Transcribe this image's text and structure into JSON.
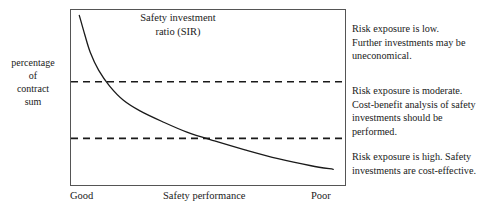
{
  "chart_data": {
    "type": "line",
    "title": "Safety investment ratio (SIR)",
    "title_lines": [
      "Safety investment",
      "ratio (SIR)"
    ],
    "xlabel": "Safety performance",
    "ylabel": "percentage of contract sum",
    "ylabel_lines": [
      "percentage",
      "of",
      "contract",
      "sum"
    ],
    "x_tick_labels": [
      "Good",
      "Safety performance",
      "Poor"
    ],
    "grid": false,
    "legend": "none",
    "xlim": [
      0,
      1
    ],
    "ylim": [
      0,
      1
    ],
    "series": [
      {
        "name": "Safety investment ratio (SIR)",
        "style": "solid",
        "color": "#1a1a1a",
        "x": [
          0.03,
          0.05,
          0.07,
          0.1,
          0.14,
          0.19,
          0.25,
          0.33,
          0.42,
          0.52,
          0.63,
          0.75,
          0.87,
          0.95
        ],
        "y": [
          0.97,
          0.86,
          0.76,
          0.66,
          0.57,
          0.49,
          0.43,
          0.37,
          0.31,
          0.26,
          0.21,
          0.16,
          0.12,
          0.1
        ]
      }
    ],
    "threshold_lines": [
      {
        "name": "upper-threshold",
        "style": "dashed",
        "color": "#1a1a1a",
        "y": 0.595
      },
      {
        "name": "lower-threshold",
        "style": "dashed",
        "color": "#1a1a1a",
        "y": 0.275
      }
    ],
    "annotations": [
      {
        "name": "low-risk",
        "zone": "above-upper-threshold",
        "lines": [
          "Risk exposure is low.",
          "Further investments may be",
          "uneconomical."
        ]
      },
      {
        "name": "moderate-risk",
        "zone": "between-thresholds",
        "lines": [
          "Risk exposure is moderate.",
          "Cost-benefit analysis of safety",
          "investments should be",
          "performed."
        ]
      },
      {
        "name": "high-risk",
        "zone": "below-lower-threshold",
        "lines": [
          "Risk exposure is high. Safety",
          "investments are cost-effective."
        ]
      }
    ]
  },
  "axis": {
    "y_label_line_1": "percentage",
    "y_label_line_2": "of",
    "y_label_line_3": "contract",
    "y_label_line_4": "sum",
    "x_tick_left": "Good",
    "x_tick_center": "Safety performance",
    "x_tick_right": "Poor"
  },
  "title": {
    "line_1": "Safety investment",
    "line_2": "ratio (SIR)"
  },
  "annotations": {
    "low": {
      "line_1": "Risk exposure is low.",
      "line_2": "Further investments may be",
      "line_3": "uneconomical."
    },
    "moderate": {
      "line_1": "Risk exposure is moderate.",
      "line_2": "Cost-benefit analysis of safety",
      "line_3": "investments should be",
      "line_4": "performed."
    },
    "high": {
      "line_1": "Risk exposure is high. Safety",
      "line_2": "investments are cost-effective."
    }
  },
  "colors": {
    "curve": "#1a1a1a",
    "frame": "#555555",
    "text": "#1a1a1a",
    "background": "#ffffff"
  }
}
